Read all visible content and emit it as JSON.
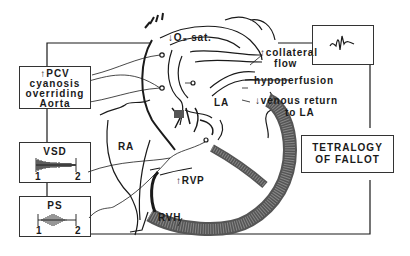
{
  "diagram": {
    "title": "TETRALOGY OF FALLOT",
    "title_lines": [
      "TETRALOGY",
      "OF FALLOT"
    ],
    "chambers": {
      "ra": "RA",
      "la": "LA",
      "rvp": "↑RVP",
      "rvh": "RVH"
    },
    "annotations": {
      "o2_sat": "↓O₂ sat.",
      "collateral_flow_line1": "↑collateral",
      "collateral_flow_line2": "flow",
      "hypoperfusion": "hypoperfusion",
      "venous_return_line1": "↓venous return",
      "venous_return_line2": "to LA"
    },
    "left_box": {
      "lines": [
        "↑PCV",
        "cyanosis",
        "overriding",
        "Aorta"
      ]
    },
    "vsd_box": {
      "label": "VSD",
      "start": "1",
      "end": "2"
    },
    "ps_box": {
      "label": "PS",
      "start": "1",
      "end": "2"
    },
    "ecg_box": {
      "icon": "ecg-waveform-icon"
    },
    "colors": {
      "ink": "#1a1a1a",
      "background": "#ffffff"
    }
  }
}
